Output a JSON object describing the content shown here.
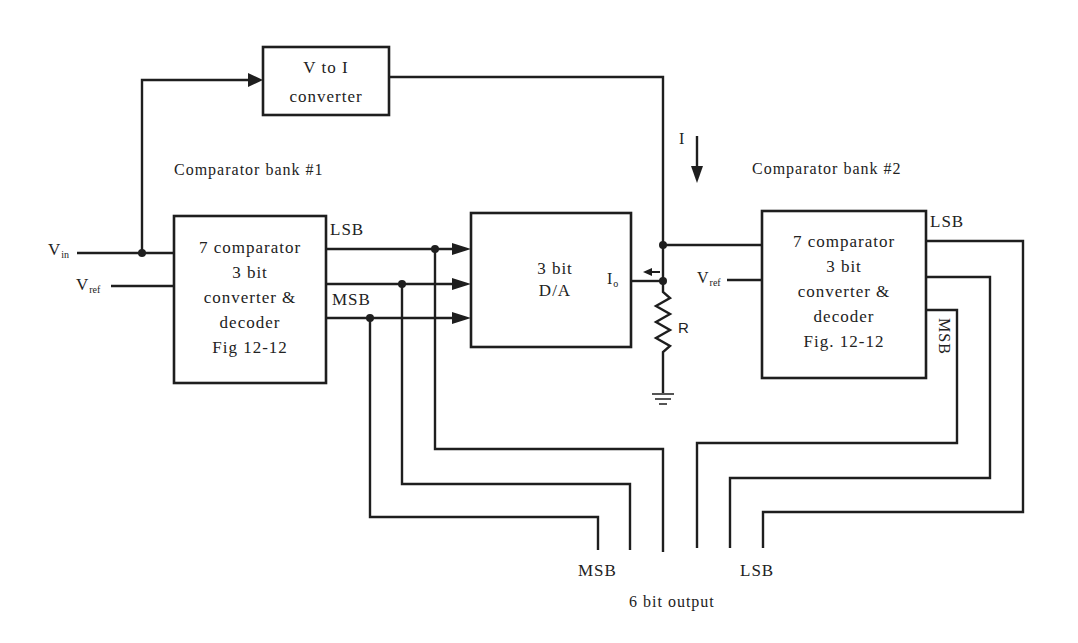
{
  "diagram": {
    "v_to_i": {
      "line1": "V to I",
      "line2": "converter"
    },
    "bank1_title": "Comparator bank #1",
    "bank2_title": "Comparator bank #2",
    "comparator1": {
      "line1": "7 comparator",
      "line2": "3 bit",
      "line3": "converter &",
      "line4": "decoder",
      "line5": "Fig 12-12"
    },
    "comparator2": {
      "line1": "7 comparator",
      "line2": "3 bit",
      "line3": "converter &",
      "line4": "decoder",
      "line5": "Fig. 12-12"
    },
    "dac": {
      "line1": "3 bit",
      "line2": "D/A"
    },
    "inputs": {
      "vin_main": "V",
      "vin_sub": "in",
      "vref_main": "V",
      "vref_sub": "ref"
    },
    "vref2": {
      "main": "V",
      "sub": "ref"
    },
    "io": {
      "main": "I",
      "sub": "o"
    },
    "current_label": "I",
    "resistor_label": "R",
    "bank1_lsb": "LSB",
    "bank1_msb": "MSB",
    "bank2_lsb": "LSB",
    "bank2_msb": "MSB",
    "output_msb": "MSB",
    "output_lsb": "LSB",
    "output_caption": "6 bit output"
  }
}
